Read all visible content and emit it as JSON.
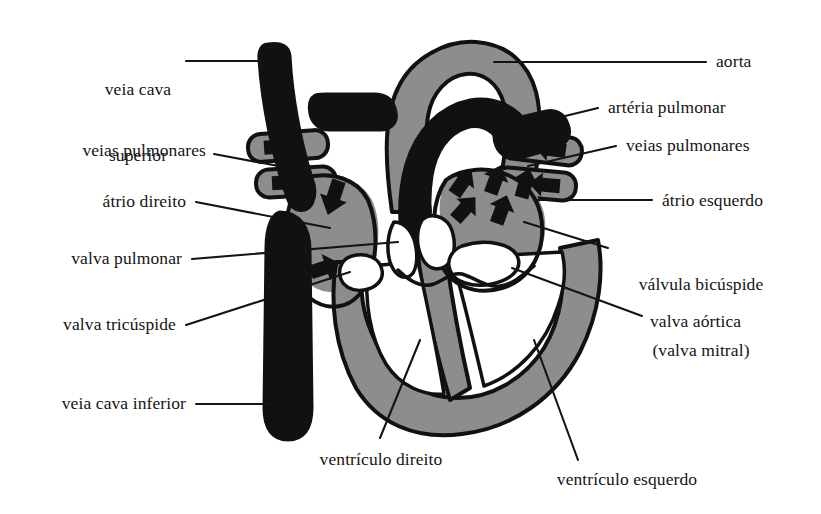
{
  "figure": {
    "language": "pt",
    "background_color": "#ffffff",
    "ink_color": "#141414",
    "muscle_gray": "#8d8d8d",
    "vessel_black": "#111111",
    "chamber_white": "#ffffff"
  },
  "labels": {
    "veia_cava_superior_l1": "veia cava",
    "veia_cava_superior_l2": "superior",
    "veias_pulmonares_left": "veias pulmonares",
    "atrio_direito": "átrio direito",
    "valva_pulmonar": "valva pulmonar",
    "valva_tricuspide": "valva tricúspide",
    "veia_cava_inferior": "veia cava inferior",
    "aorta": "aorta",
    "arteria_pulmonar": "artéria pulmonar",
    "veias_pulmonares_right": "veias pulmonares",
    "atrio_esquerdo": "átrio esquerdo",
    "valvula_bicuspide_l1": "válvula bicúspide",
    "valvula_bicuspide_l2": "(valva mitral)",
    "valva_aortica": "valva aórtica",
    "ventriculo_direito": "ventrículo direito",
    "ventriculo_esquerdo": "ventrículo esquerdo"
  },
  "flow_arrows": {
    "pulmonary_vein_left_upper": "arrow-right",
    "pulmonary_vein_left_lower": "arrow-right",
    "pulmonary_vein_right_upper": "arrow-left",
    "pulmonary_vein_right_lower": "arrow-left",
    "right_atrium_inflow": "arrow-down",
    "right_atrium_to_ventricle": "arrow-right",
    "left_atrium_1": "arrow-down-left",
    "left_atrium_2": "arrow-down",
    "left_atrium_3": "arrow-down-left",
    "left_atrium_4": "arrow-down-left",
    "left_atrium_5": "arrow-left"
  }
}
